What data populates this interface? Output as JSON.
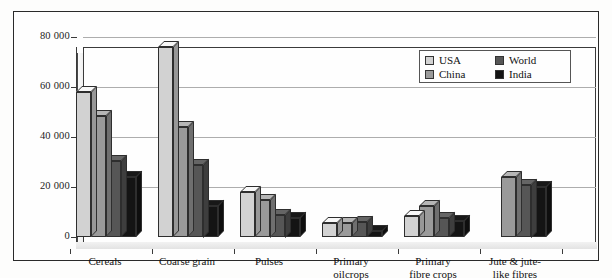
{
  "chart_data": {
    "type": "bar",
    "title": "",
    "subtitle": "",
    "xlabel": "",
    "ylabel": "",
    "ylim": [
      0,
      80000
    ],
    "yticks": [
      "0",
      "20 000",
      "40 000",
      "60 000",
      "80 000"
    ],
    "ytick_values": [
      0,
      20000,
      40000,
      60000,
      80000
    ],
    "grid": true,
    "legend_position": "top-right",
    "categories": [
      "Cereals",
      "Coarse grain",
      "Pulses",
      "Primary\noilcrops",
      "Primary\nfibre crops",
      "Jute & jute-\nlike fibres"
    ],
    "series": [
      {
        "name": "USA",
        "color": "#d2d2d2",
        "values": [
          58000,
          76000,
          18000,
          5500,
          8500,
          0
        ]
      },
      {
        "name": "China",
        "color": "#9a9a9a",
        "values": [
          48500,
          44000,
          15000,
          5500,
          12500,
          24000
        ]
      },
      {
        "name": "World",
        "color": "#565656",
        "values": [
          30500,
          29000,
          9000,
          6000,
          7500,
          21000
        ]
      },
      {
        "name": "India",
        "color": "#141414",
        "values": [
          24000,
          12500,
          7500,
          2500,
          6500,
          20000
        ]
      }
    ]
  },
  "legend": {
    "entries": [
      {
        "label": "USA",
        "color": "#d2d2d2"
      },
      {
        "label": "World",
        "color": "#565656"
      },
      {
        "label": "China",
        "color": "#9a9a9a"
      },
      {
        "label": "India",
        "color": "#141414"
      }
    ]
  }
}
